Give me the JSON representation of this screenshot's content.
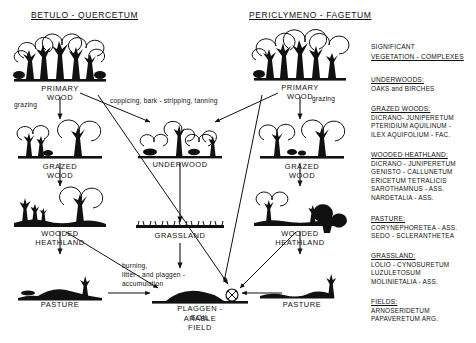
{
  "titles": {
    "left": "BETULO - QUERCETUM",
    "right": "PERICLYMENO - FAGETUM"
  },
  "nodes": {
    "primary_wood_left": "PRIMARY WOOD",
    "primary_wood_right": "PRIMARY WOOD",
    "grazed_wood_left": "GRAZED WOOD",
    "grazed_wood_right": "GRAZED WOOD",
    "underwood": "UNDERWOOD",
    "wooded_heathland_left": "WOODED HEATHLAND",
    "wooded_heathland_right": "WOODED HEATHLAND",
    "grassland": "GRASSLAND",
    "pasture_left": "PASTURE",
    "pasture_right": "PASTURE",
    "plaggen_line1": "PLAGGEN - SOIL",
    "plaggen_line2": "ARABLE FIELD"
  },
  "processes": {
    "grazing_left": "grazing",
    "grazing_right": "grazing",
    "coppicing": "coppicing, bark - stripping, tanning",
    "burning_line1": "burning,",
    "burning_line2": "litter - and plaggen -",
    "burning_line3": "accumulation"
  },
  "legend": {
    "heading_line1": "SIGNIFICANT",
    "heading_line2": "VEGETATION - COMPLEXES",
    "groups": [
      {
        "head": "UNDERWOODS:",
        "lines": [
          "OAKS and BIRCHES"
        ]
      },
      {
        "head": "GRAZED WOODS:",
        "lines": [
          "DICRANO- JUNIPERETUM",
          "PTERIDIUM AQUILINUM -",
          "ILEX AQUIFOLIUM - FAC."
        ]
      },
      {
        "head": "WOODED HEATHLAND:",
        "lines": [
          "DICRANO - JUNIPERETUM",
          "GENISTO - CALLUNETUM",
          "ERICETUM TETRALICIS",
          "SAROTHAMNUS - ASS.",
          "NARDETALIA - ASS."
        ]
      },
      {
        "head": "PASTURE:",
        "lines": [
          "CORYNEPHORETEA - ASS.",
          "SEDO - SCLERANTHETEA"
        ]
      },
      {
        "head": "GRASSLAND:",
        "lines": [
          "LOLIO - CYNOSURETUM",
          "LUZULETOSUM",
          "MOLINIETALIA - ASS."
        ]
      },
      {
        "head": "FIELDS:",
        "lines": [
          "ARNOSERIDETUM",
          "PAPAVERETUM ARG."
        ]
      }
    ]
  },
  "colors": {
    "ink": "#111111",
    "paper": "#ffffff"
  }
}
